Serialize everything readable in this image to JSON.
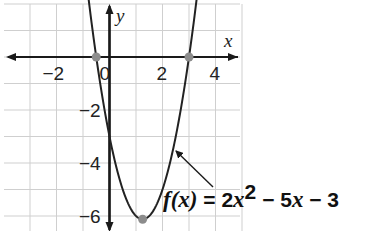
{
  "chart_data": {
    "type": "line",
    "title": "",
    "function": "f(x) = 2x^2 - 5x - 3",
    "annotation": {
      "label_parts": [
        "f(x)",
        " = 2",
        "x",
        "2",
        " − 5",
        "x",
        " − 3"
      ],
      "text": "f(x) = 2x² − 5x − 3",
      "points_to": [
        2.5,
        -3
      ]
    },
    "xlabel": "x",
    "ylabel": "y",
    "xlim": [
      -4,
      5
    ],
    "ylim": [
      -6.5,
      2
    ],
    "x_ticks": [
      {
        "value": -2,
        "label": "−2"
      },
      {
        "value": 0,
        "label": "0"
      },
      {
        "value": 2,
        "label": "2"
      },
      {
        "value": 4,
        "label": "4"
      }
    ],
    "y_ticks": [
      {
        "value": -2,
        "label": "−2"
      },
      {
        "value": -4,
        "label": "−4"
      },
      {
        "value": -6,
        "label": "−6"
      }
    ],
    "grid": true,
    "grid_step": 1,
    "series": [
      {
        "name": "f(x) = 2x^2 - 5x - 3",
        "x": [
          -0.9,
          -0.5,
          0,
          0.5,
          1,
          1.25,
          1.5,
          2,
          2.5,
          3,
          3.4
        ],
        "y": [
          2.12,
          0,
          -3,
          -5,
          -6,
          -6.125,
          -6,
          -5,
          -3,
          0,
          2.12
        ]
      }
    ],
    "highlighted_points": [
      {
        "name": "root-left",
        "x": -0.5,
        "y": 0
      },
      {
        "name": "root-right",
        "x": 3,
        "y": 0
      },
      {
        "name": "vertex",
        "x": 1.25,
        "y": -6.125
      }
    ],
    "colors": {
      "curve": "#222222",
      "points": "#8c8c8c",
      "grid": "#cfcfcf",
      "axes": "#1a1a1a"
    }
  }
}
